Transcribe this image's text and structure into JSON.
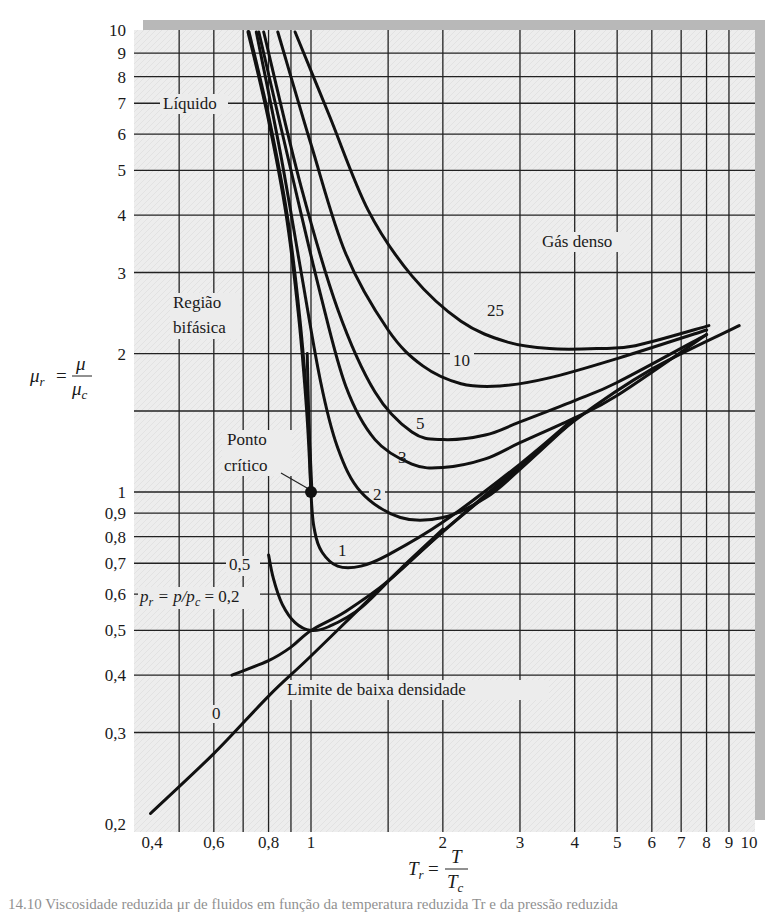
{
  "chart_data": {
    "type": "line",
    "title": "",
    "xlabel": "T_r = T / T_c",
    "ylabel": "μ_r = μ / μ_c",
    "xscale": "log",
    "yscale": "log",
    "xlim": [
      0.4,
      10
    ],
    "ylim": [
      0.2,
      10
    ],
    "grid": true,
    "x_ticks": [
      "0,4",
      "0,6",
      "0,8",
      "1",
      "2",
      "3",
      "4",
      "5",
      "6",
      "7",
      "8",
      "9",
      "10"
    ],
    "x_tick_values": [
      0.4,
      0.6,
      0.8,
      1,
      2,
      3,
      4,
      5,
      6,
      7,
      8,
      9,
      10
    ],
    "x_grid_values": [
      0.5,
      0.6,
      0.7,
      0.8,
      0.9,
      1,
      1.5,
      2,
      3,
      4,
      5,
      6,
      7,
      8,
      9
    ],
    "y_ticks": [
      "0,2",
      "0,3",
      "0,4",
      "0,5",
      "0,6",
      "0,7",
      "0,8",
      "0,9",
      "1",
      "2",
      "3",
      "4",
      "5",
      "6",
      "7",
      "8",
      "9",
      "10"
    ],
    "y_tick_values": [
      0.2,
      0.3,
      0.4,
      0.5,
      0.6,
      0.7,
      0.8,
      0.9,
      1,
      2,
      3,
      4,
      5,
      6,
      7,
      8,
      9,
      10
    ],
    "y_grid_values": [
      0.3,
      0.4,
      0.5,
      0.6,
      0.7,
      0.8,
      0.9,
      1,
      1.5,
      2,
      3,
      4,
      5,
      6,
      7,
      8,
      9
    ],
    "series": [
      {
        "name": "0",
        "label": "0",
        "x": [
          0.43,
          0.6,
          0.8,
          1.0,
          1.5,
          2.0,
          3.0,
          4.0,
          6.0,
          9.5
        ],
        "y": [
          0.2,
          0.27,
          0.36,
          0.44,
          0.64,
          0.82,
          1.13,
          1.43,
          1.85,
          2.3
        ]
      },
      {
        "name": "0.2",
        "label": "p_r = p/p_c = 0,2",
        "x": [
          0.66,
          0.8,
          0.9,
          1.0,
          1.2,
          1.5,
          2.0,
          3.0,
          4.0
        ],
        "y": [
          0.4,
          0.43,
          0.46,
          0.5,
          0.55,
          0.64,
          0.82,
          1.14,
          1.44
        ]
      },
      {
        "name": "0.5",
        "label": "0,5",
        "x": [
          0.8,
          0.82,
          0.86,
          0.92,
          1.0,
          1.1,
          1.3,
          1.6,
          2.0
        ],
        "y": [
          0.73,
          0.65,
          0.57,
          0.52,
          0.5,
          0.51,
          0.56,
          0.68,
          0.83
        ]
      },
      {
        "name": "1",
        "label": "1",
        "x": [
          0.98,
          1.0,
          1.02,
          1.06,
          1.15,
          1.3,
          1.5,
          2.0,
          3.0,
          4.0
        ],
        "y": [
          2.0,
          1.0,
          0.82,
          0.74,
          0.69,
          0.69,
          0.73,
          0.86,
          1.15,
          1.45
        ]
      },
      {
        "name": "2",
        "label": "2",
        "x": [
          0.75,
          0.85,
          0.95,
          1.05,
          1.15,
          1.3,
          1.6,
          2.0,
          2.5,
          3.0,
          4.0
        ],
        "y": [
          10,
          5.5,
          3.0,
          1.75,
          1.25,
          1.0,
          0.88,
          0.88,
          0.97,
          1.12,
          1.44
        ]
      },
      {
        "name": "3",
        "label": "3",
        "x": [
          0.76,
          0.9,
          1.05,
          1.2,
          1.4,
          1.7,
          2.0,
          2.5,
          3.0,
          4.0,
          5.0,
          8.0
        ],
        "y": [
          10,
          5.0,
          2.7,
          1.7,
          1.3,
          1.15,
          1.13,
          1.18,
          1.28,
          1.45,
          1.62,
          2.2
        ]
      },
      {
        "name": "5",
        "label": "5",
        "x": [
          0.78,
          0.95,
          1.15,
          1.4,
          1.7,
          2.0,
          2.5,
          3.0,
          4.0,
          5.0,
          8.0
        ],
        "y": [
          10,
          4.6,
          2.5,
          1.65,
          1.35,
          1.3,
          1.33,
          1.42,
          1.58,
          1.73,
          2.2
        ]
      },
      {
        "name": "10",
        "label": "10",
        "x": [
          0.84,
          1.0,
          1.2,
          1.5,
          1.8,
          2.2,
          2.7,
          3.5,
          5.0,
          8.0
        ],
        "y": [
          10,
          5.7,
          3.3,
          2.25,
          1.88,
          1.72,
          1.7,
          1.77,
          1.95,
          2.25
        ]
      },
      {
        "name": "25",
        "label": "25",
        "x": [
          0.92,
          1.1,
          1.35,
          1.7,
          2.2,
          2.8,
          3.5,
          4.5,
          5.5,
          8.1
        ],
        "y": [
          10,
          6.6,
          4.1,
          2.95,
          2.35,
          2.12,
          2.05,
          2.05,
          2.08,
          2.3
        ]
      },
      {
        "name": "saturation",
        "label": "",
        "x": [
          0.72,
          0.8,
          0.88,
          0.94,
          0.98,
          1.0,
          1.0
        ],
        "y": [
          10,
          6.5,
          4.0,
          2.4,
          1.5,
          1.05,
          1.0
        ]
      }
    ],
    "annotations": [
      {
        "text": "Líquido",
        "x": 0.58,
        "y": 7
      },
      {
        "text": "Gás denso",
        "x": 4.3,
        "y": 3.9
      },
      {
        "text": "Região bifásica",
        "x": 0.6,
        "y": 2.6
      },
      {
        "text": "Ponto crítico",
        "x": 0.85,
        "y": 1.15,
        "points_to": [
          1,
          1
        ]
      },
      {
        "text": "Limite de baixa densidade",
        "x": 1.5,
        "y": 0.36
      },
      {
        "text": "p_r = p/p_c = 0,2",
        "x": 0.55,
        "y": 0.44
      }
    ],
    "critical_point": {
      "x": 1,
      "y": 1
    }
  },
  "labels": {
    "liquid": "Líquido",
    "dense_gas": "Gás denso",
    "two_phase_1": "Região",
    "two_phase_2": "bifásica",
    "critical_1": "Ponto",
    "critical_2": "crítico",
    "low_density": "Limite de baixa densidade",
    "pr_prefix": "p",
    "pr_sub": "r",
    "pr_mid": " = p/p",
    "pr_sub2": "c",
    "pr_value": " = 0,2",
    "curve_0": "0",
    "curve_05": "0,5",
    "curve_1": "1",
    "curve_2": "2",
    "curve_3": "3",
    "curve_5": "5",
    "curve_10": "10",
    "curve_25": "25"
  },
  "axes": {
    "y_label_main": "μ",
    "y_label_sub": "r",
    "y_label_num": "μ",
    "y_label_den": "μ",
    "y_label_den_sub": "c",
    "x_label_main": "T",
    "x_label_sub": "r",
    "x_label_num": "T",
    "x_label_den": "T",
    "x_label_den_sub": "c"
  },
  "caption": "14.10 Viscosidade reduzida μr de fluidos em função da temperatura reduzida Tr e da pressão reduzida"
}
